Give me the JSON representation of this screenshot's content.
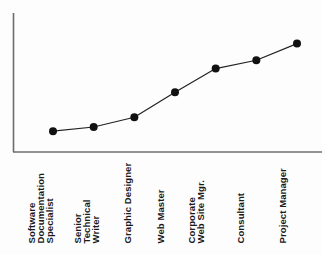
{
  "chart_data": {
    "type": "line",
    "title": "",
    "subtitle": "",
    "xlabel": "",
    "ylabel": "",
    "grid": false,
    "legend": "none",
    "axis": {
      "x_axis_visible": true,
      "y_axis_visible": true,
      "x_tick_labels_rotated_deg": 90,
      "ylim": [
        0,
        100
      ],
      "y_ticks_visible": false,
      "x_ticks_visible": false
    },
    "categories": [
      "Software Documentation Specialist",
      "Senior Technical Writer",
      "Graphic Designer",
      "Web Master",
      "Corporate Web Site Mgr.",
      "Consultant",
      "Project Manager"
    ],
    "category_label_lines": [
      [
        "Software",
        "Documentation",
        "Specialist"
      ],
      [
        "Senior",
        "Technical",
        "Writer"
      ],
      [
        "Graphic Designer"
      ],
      [
        "Web Master"
      ],
      [
        "Corporate",
        "Web Site Mgr."
      ],
      [
        "Consultant"
      ],
      [
        "Project Manager"
      ]
    ],
    "values": [
      15,
      18,
      25,
      43,
      60,
      66,
      78
    ],
    "series": [
      {
        "name": "",
        "values": [
          15,
          18,
          25,
          43,
          60,
          66,
          78
        ],
        "marker": "circle",
        "marker_color": "#111111",
        "line_color": "#222222",
        "line_width": 1.2,
        "marker_size": 4
      }
    ],
    "annotations": []
  },
  "style": {
    "background": "#fdfdfd",
    "axis_color": "#6d6d6d",
    "line_color": "#222222",
    "marker_color": "#111111",
    "label_color": "#1a1a1a"
  }
}
